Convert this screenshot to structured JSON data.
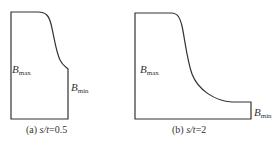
{
  "panels": [
    {
      "id": "a",
      "caption_prefix": "(a) ",
      "caption_var": "s/t",
      "caption_value": "=0.5",
      "label_max_base": "B",
      "label_max_sub": "max",
      "label_min_base": "B",
      "label_min_sub": "min"
    },
    {
      "id": "b",
      "caption_prefix": "(b) ",
      "caption_var": "s/t",
      "caption_value": "=2",
      "label_max_base": "B",
      "label_max_sub": "max",
      "label_min_base": "B",
      "label_min_sub": "min"
    }
  ],
  "colors": {
    "stroke": "#333333",
    "background": "#ffffff"
  }
}
